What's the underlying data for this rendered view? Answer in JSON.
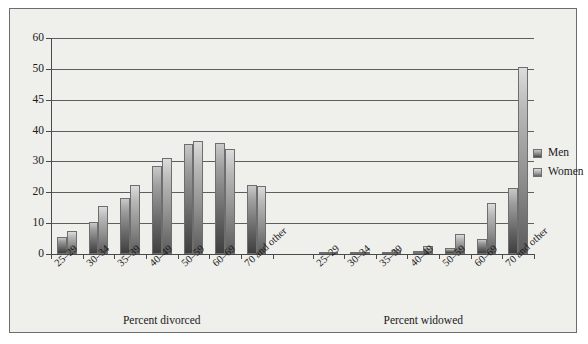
{
  "chart_data": {
    "type": "bar",
    "title": "",
    "xlabel": "",
    "ylabel": "",
    "grid": true,
    "legend_position": "right",
    "ylim": [
      0,
      60
    ],
    "ytick_labels": [
      "60",
      "50",
      "45",
      "40",
      "30",
      "20",
      "10",
      "0"
    ],
    "ytick_values": [
      60,
      50,
      45,
      40,
      30,
      20,
      10,
      0
    ],
    "categories": [
      "25–29",
      "30–34",
      "35–39",
      "40–49",
      "50–59",
      "60–69",
      "70 and other"
    ],
    "groups": [
      {
        "label": "Percent divorced",
        "series": [
          {
            "name": "Men",
            "values": [
              5.5,
              10.5,
              18.0,
              28.5,
              35.5,
              36.0,
              22.5
            ]
          },
          {
            "name": "Women",
            "values": [
              7.5,
              15.5,
              22.5,
              31.0,
              36.5,
              34.0,
              22.0
            ]
          }
        ]
      },
      {
        "label": "Percent widowed",
        "series": [
          {
            "name": "Men",
            "values": [
              0.2,
              0.3,
              0.5,
              1.0,
              2.0,
              5.0,
              21.5
            ]
          },
          {
            "name": "Women",
            "values": [
              0.3,
              0.6,
              1.3,
              2.5,
              6.5,
              16.5,
              50.5
            ]
          }
        ]
      }
    ],
    "legend": [
      "Men",
      "Women"
    ],
    "colors": {
      "men": "#6a6a6a",
      "women": "#8c8c8c",
      "axis": "#4a4a4a",
      "grid": "#5e5e5e",
      "background": "#efefec",
      "frame": "#6d6d6d"
    }
  }
}
